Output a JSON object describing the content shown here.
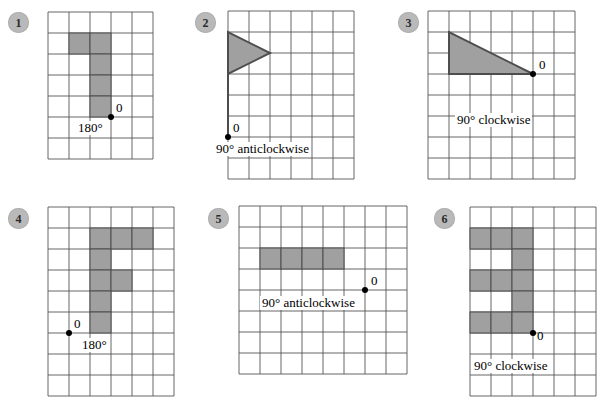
{
  "page": {
    "background_color": "#ffffff",
    "grid_line_color": "#555555",
    "shape_fill_color": "#a0a0a0",
    "shape_stroke_color": "#4d4d4d",
    "point_color": "#000000",
    "badge_color": "#b9b9b9"
  },
  "panels": [
    {
      "number": "1",
      "origin_label": "0",
      "rotation_label": "180°",
      "shape_type": "polyomino",
      "grid": {
        "cols": 5,
        "rows": 7,
        "cell": 21
      },
      "cells": [
        {
          "col": 1,
          "row": 1
        },
        {
          "col": 2,
          "row": 1
        },
        {
          "col": 2,
          "row": 2
        },
        {
          "col": 2,
          "row": 3
        },
        {
          "col": 2,
          "row": 4
        }
      ],
      "origin_point": {
        "col": 3,
        "row": 5
      }
    },
    {
      "number": "2",
      "origin_label": "0",
      "rotation_label": "90° anticlockwise",
      "shape_type": "flag-triangle",
      "grid": {
        "cols": 7,
        "rows": 7,
        "cell": 21
      },
      "triangle_points": "1,1 1,3 3,2",
      "pole": {
        "from": {
          "col": 1,
          "row": 3
        },
        "to": {
          "col": 1,
          "row": 6
        }
      },
      "origin_point": {
        "col": 1,
        "row": 6
      }
    },
    {
      "number": "3",
      "origin_label": "0",
      "rotation_label": "90° clockwise",
      "shape_type": "right-triangle",
      "grid": {
        "cols": 7,
        "rows": 7,
        "cell": 21
      },
      "triangle_points": "1,1 1,3 5,3",
      "origin_point": {
        "col": 5,
        "row": 3
      }
    },
    {
      "number": "4",
      "origin_label": "0",
      "rotation_label": "180°",
      "shape_type": "polyomino",
      "grid": {
        "cols": 6,
        "rows": 8,
        "cell": 21
      },
      "cells": [
        {
          "col": 2,
          "row": 1
        },
        {
          "col": 3,
          "row": 1
        },
        {
          "col": 4,
          "row": 1
        },
        {
          "col": 2,
          "row": 2
        },
        {
          "col": 2,
          "row": 3
        },
        {
          "col": 3,
          "row": 3
        },
        {
          "col": 2,
          "row": 4
        },
        {
          "col": 2,
          "row": 5
        }
      ],
      "origin_point": {
        "col": 1,
        "row": 6
      }
    },
    {
      "number": "5",
      "origin_label": "0",
      "rotation_label": "90° anticlockwise",
      "shape_type": "polyomino",
      "grid": {
        "cols": 8,
        "rows": 8,
        "cell": 21
      },
      "cells": [
        {
          "col": 1,
          "row": 2
        },
        {
          "col": 2,
          "row": 2
        },
        {
          "col": 3,
          "row": 2
        },
        {
          "col": 4,
          "row": 2
        }
      ],
      "origin_point": {
        "col": 6,
        "row": 4
      }
    },
    {
      "number": "6",
      "origin_label": "0",
      "rotation_label": "90° clockwise",
      "shape_type": "polyomino",
      "grid": {
        "cols": 6,
        "rows": 8,
        "cell": 21
      },
      "cells": [
        {
          "col": 1,
          "row": 1
        },
        {
          "col": 2,
          "row": 1
        },
        {
          "col": 3,
          "row": 1
        },
        {
          "col": 3,
          "row": 2
        },
        {
          "col": 1,
          "row": 3
        },
        {
          "col": 2,
          "row": 3
        },
        {
          "col": 3,
          "row": 3
        },
        {
          "col": 3,
          "row": 4
        },
        {
          "col": 1,
          "row": 5
        },
        {
          "col": 2,
          "row": 5
        },
        {
          "col": 3,
          "row": 5
        }
      ],
      "origin_point": {
        "col": 4,
        "row": 6
      }
    }
  ]
}
